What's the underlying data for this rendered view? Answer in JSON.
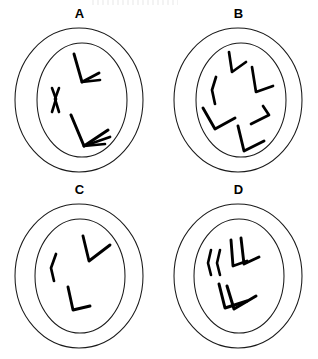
{
  "figure": {
    "title": "",
    "background_color": "#ffffff",
    "stroke_color": "#000000",
    "panel_count": 4
  },
  "panels": [
    {
      "id": "A",
      "label": "A",
      "position": "top-left",
      "description": "Cell with nucleus containing 3 chromosome groups",
      "chromosome_count": 3,
      "cell": {
        "membrane": {
          "cx": 79,
          "cy": 80,
          "rx": 64,
          "ry": 72
        },
        "nucleus": {
          "cx": 82,
          "cy": 80,
          "rx": 45,
          "ry": 57
        }
      },
      "chromosomes": [
        {
          "name": "x-shaped-chromosome",
          "shape": "X",
          "cx": 55,
          "cy": 80
        },
        {
          "name": "v-chromosome-upper",
          "shape": "V-pair",
          "cx": 85,
          "cy": 50
        },
        {
          "name": "v-chromosome-lower",
          "shape": "V-pair",
          "cx": 85,
          "cy": 112
        }
      ]
    },
    {
      "id": "B",
      "label": "B",
      "position": "top-right",
      "description": "Cell with nucleus containing 6 scattered chromosomes",
      "chromosome_count": 6,
      "cell": {
        "membrane": {
          "cx": 79,
          "cy": 80,
          "rx": 64,
          "ry": 72
        },
        "nucleus": {
          "cx": 82,
          "cy": 80,
          "rx": 45,
          "ry": 57
        }
      },
      "chromosomes": [
        {
          "name": "chromosome-1",
          "shape": "V",
          "cx": 74,
          "cy": 46
        },
        {
          "name": "chromosome-2",
          "shape": "V",
          "cx": 101,
          "cy": 64
        },
        {
          "name": "chromosome-3",
          "shape": "rod",
          "cx": 55,
          "cy": 70
        },
        {
          "name": "chromosome-4",
          "shape": "V",
          "cx": 58,
          "cy": 100
        },
        {
          "name": "chromosome-5",
          "shape": "V",
          "cx": 104,
          "cy": 96
        },
        {
          "name": "chromosome-6",
          "shape": "V",
          "cx": 90,
          "cy": 120
        }
      ]
    },
    {
      "id": "C",
      "label": "C",
      "position": "bottom-left",
      "description": "Cell with nucleus containing 3 single chromosomes",
      "chromosome_count": 3,
      "cell": {
        "membrane": {
          "cx": 79,
          "cy": 80,
          "rx": 64,
          "ry": 72
        },
        "nucleus": {
          "cx": 80,
          "cy": 80,
          "rx": 45,
          "ry": 57
        }
      },
      "chromosomes": [
        {
          "name": "rod-chromosome",
          "shape": "rod",
          "cx": 54,
          "cy": 72
        },
        {
          "name": "v-chromosome-upper",
          "shape": "V",
          "cx": 92,
          "cy": 56
        },
        {
          "name": "v-chromosome-lower",
          "shape": "V",
          "cx": 75,
          "cy": 106
        }
      ]
    },
    {
      "id": "D",
      "label": "D",
      "position": "bottom-right",
      "description": "Cell with nucleus containing 3 duplicated chromosome pairs",
      "chromosome_count": 3,
      "cell": {
        "membrane": {
          "cx": 79,
          "cy": 80,
          "rx": 64,
          "ry": 72
        },
        "nucleus": {
          "cx": 80,
          "cy": 80,
          "rx": 45,
          "ry": 57
        }
      },
      "chromosomes": [
        {
          "name": "rod-pair",
          "shape": "rod-pair",
          "cx": 56,
          "cy": 66
        },
        {
          "name": "v-pair-upper",
          "shape": "V-pair",
          "cx": 84,
          "cy": 58
        },
        {
          "name": "v-pair-lower",
          "shape": "V-pair",
          "cx": 78,
          "cy": 100
        }
      ]
    }
  ]
}
